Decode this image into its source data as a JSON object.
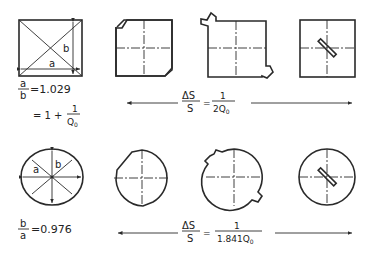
{
  "figure": {
    "rows": [
      {
        "name": "square-cavity-row",
        "ratio_label": {
          "num": "a",
          "den": "b",
          "value": "=1.029"
        },
        "second_label": {
          "prefix": "= 1 +",
          "num": "1",
          "den": "Q",
          "den_sub": "0"
        },
        "formula": {
          "lhs_num": "ΔS",
          "lhs_den": "S",
          "eq": "=",
          "rhs_num": "1",
          "rhs_den": "2Q",
          "rhs_den_sub": "0"
        },
        "dimension_labels": {
          "a": "a",
          "b": "b"
        },
        "shapes": [
          "square-with-diagonals",
          "square-cut-corners",
          "square-with-notches",
          "square-with-slot"
        ]
      },
      {
        "name": "circular-cavity-row",
        "ratio_label": {
          "num": "b",
          "den": "a",
          "value": "=0.976"
        },
        "formula": {
          "lhs_num": "ΔS",
          "lhs_den": "S",
          "eq": "=",
          "rhs_num": "1",
          "rhs_den": "1.841Q",
          "rhs_den_sub": "0"
        },
        "dimension_labels": {
          "a": "a",
          "b": "b"
        },
        "shapes": [
          "circle-with-diameters",
          "circle-flattened",
          "circle-with-notches",
          "circle-with-slot"
        ]
      }
    ]
  }
}
